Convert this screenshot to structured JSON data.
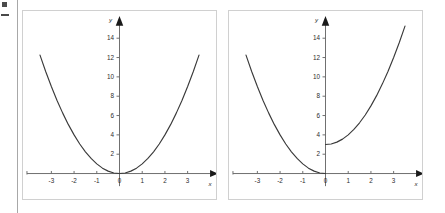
{
  "figure": {
    "background_color": "#ffffff",
    "axis_color": "#6e6e6e",
    "curve_color": "#3a3a3a",
    "panel_border_color": "#d0d0d0"
  },
  "margin_marks": {
    "rule_label": "page-edge-rule",
    "mark_top_label": "edge-mark-upper",
    "mark_lower_label": "edge-mark-lower"
  },
  "chart_data": [
    {
      "type": "line",
      "title": "",
      "xlabel": "x",
      "ylabel": "y",
      "xlim": [
        -3.9,
        3.9
      ],
      "ylim": [
        -1.2,
        16.2
      ],
      "grid": false,
      "legend": null,
      "xticks": [
        -3,
        -2,
        -1,
        0,
        1,
        2,
        3
      ],
      "xticklabels": [
        "-3",
        "-2",
        "-1",
        "0",
        "1",
        "2",
        "3"
      ],
      "yticks": [
        2,
        4,
        6,
        8,
        10,
        12,
        14
      ],
      "yticklabels": [
        "2",
        "4",
        "6",
        "8",
        "10",
        "12",
        "14"
      ],
      "series": [
        {
          "name": "y = x^2",
          "x": [
            -3.5,
            -3.25,
            -3.0,
            -2.75,
            -2.5,
            -2.25,
            -2.0,
            -1.75,
            -1.5,
            -1.25,
            -1.0,
            -0.75,
            -0.5,
            -0.25,
            0.0,
            0.25,
            0.5,
            0.75,
            1.0,
            1.25,
            1.5,
            1.75,
            2.0,
            2.25,
            2.5,
            2.75,
            3.0,
            3.25,
            3.5
          ],
          "values": [
            12.25,
            10.56,
            9.0,
            7.56,
            6.25,
            5.06,
            4.0,
            3.06,
            2.25,
            1.56,
            1.0,
            0.56,
            0.25,
            0.06,
            0.0,
            0.06,
            0.25,
            0.56,
            1.0,
            1.56,
            2.25,
            3.06,
            4.0,
            5.06,
            6.25,
            7.56,
            9.0,
            10.56,
            12.25
          ]
        }
      ]
    },
    {
      "type": "line",
      "title": "",
      "xlabel": "x",
      "ylabel": "y",
      "xlim": [
        -3.9,
        3.9
      ],
      "ylim": [
        -1.2,
        16.2
      ],
      "grid": false,
      "legend": null,
      "xticks": [
        -3,
        -2,
        -1,
        0,
        1,
        2,
        3
      ],
      "xticklabels": [
        "-3",
        "-2",
        "-1",
        "0",
        "1",
        "2",
        "3"
      ],
      "yticks": [
        2,
        4,
        6,
        8,
        10,
        12,
        14
      ],
      "yticklabels": [
        "2",
        "4",
        "6",
        "8",
        "10",
        "12",
        "14"
      ],
      "series": [
        {
          "name": "y = x^2 for x < 0",
          "x": [
            -3.5,
            -3.25,
            -3.0,
            -2.75,
            -2.5,
            -2.25,
            -2.0,
            -1.75,
            -1.5,
            -1.25,
            -1.0,
            -0.75,
            -0.5,
            -0.25,
            0.0
          ],
          "values": [
            12.25,
            10.56,
            9.0,
            7.56,
            6.25,
            5.06,
            4.0,
            3.06,
            2.25,
            1.56,
            1.0,
            0.56,
            0.25,
            0.06,
            0.0
          ]
        },
        {
          "name": "y = x^2 + 3 for x >= 0",
          "x": [
            0.0,
            0.25,
            0.5,
            0.75,
            1.0,
            1.25,
            1.5,
            1.75,
            2.0,
            2.25,
            2.5,
            2.75,
            3.0,
            3.25,
            3.5
          ],
          "values": [
            3.0,
            3.06,
            3.25,
            3.56,
            4.0,
            4.56,
            5.25,
            6.06,
            7.0,
            8.06,
            9.25,
            10.56,
            12.0,
            13.56,
            15.25
          ]
        }
      ]
    }
  ]
}
